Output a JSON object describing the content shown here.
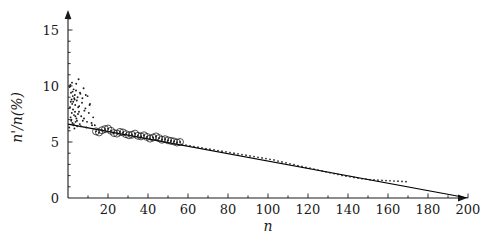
{
  "chart_data": {
    "type": "scatter",
    "title": "",
    "xlabel": "n",
    "ylabel": "n'/n(%)",
    "xlim": [
      0,
      210
    ],
    "ylim": [
      0,
      16.8
    ],
    "grid": false,
    "legend": null,
    "xticks": [
      20,
      40,
      60,
      80,
      100,
      120,
      140,
      160,
      180,
      200
    ],
    "xtick_labels": [
      "20",
      "40",
      "60",
      "80",
      "100",
      "120",
      "140",
      "160",
      "180",
      "200"
    ],
    "yticks": [
      0,
      5,
      10,
      15
    ],
    "ytick_labels": [
      "0",
      "5",
      "10",
      "15"
    ],
    "x_minor_tick_step": 10,
    "y_minor_tick_step": 1,
    "axis_style": "arrow-ended",
    "series": [
      {
        "name": "fit-line",
        "type": "line",
        "style": "solid",
        "color": "#000000",
        "points": [
          [
            0,
            6.6
          ],
          [
            200,
            0.0
          ]
        ],
        "slope": -0.033,
        "intercept": 6.6
      },
      {
        "name": "noisy-cluster",
        "type": "scatter",
        "marker": "dot",
        "color": "#1a1a1a",
        "x": [
          0.6,
          0.8,
          1.0,
          1.2,
          1.3,
          1.5,
          1.6,
          1.8,
          1.9,
          2.0,
          2.1,
          2.2,
          2.4,
          2.5,
          2.6,
          2.7,
          2.8,
          3.0,
          3.1,
          3.2,
          3.4,
          3.5,
          3.6,
          3.8,
          4.0,
          4.2,
          4.4,
          4.6,
          4.8,
          5.0,
          5.3,
          5.6,
          5.9,
          6.2,
          6.6,
          7.0,
          7.4,
          7.8,
          8.2,
          8.7,
          9.2,
          9.8,
          10.4,
          11.0,
          11.8,
          12.6,
          13.4,
          1.1,
          1.4,
          1.7,
          2.3,
          2.9,
          3.3,
          3.7,
          4.1,
          4.5,
          5.1,
          5.5,
          6.0,
          6.4,
          7.2,
          8.0,
          8.9,
          9.5,
          10.8,
          12.0
        ],
        "y": [
          6.3,
          9.9,
          8.1,
          10.1,
          7.2,
          9.4,
          6.9,
          8.8,
          7.6,
          10.3,
          8.4,
          6.7,
          9.1,
          7.9,
          8.6,
          6.5,
          9.7,
          7.4,
          8.9,
          6.2,
          9.2,
          7.7,
          8.3,
          6.8,
          9.6,
          7.1,
          8.7,
          6.4,
          9.0,
          7.5,
          10.6,
          8.2,
          6.6,
          9.3,
          7.3,
          8.5,
          6.9,
          9.8,
          7.8,
          8.0,
          6.3,
          9.1,
          7.6,
          8.4,
          6.7,
          7.2,
          6.5,
          10.0,
          8.6,
          7.0,
          9.5,
          6.6,
          8.8,
          7.3,
          10.2,
          6.9,
          8.1,
          7.7,
          9.4,
          6.4,
          8.9,
          7.1,
          9.2,
          6.8,
          8.3,
          6.5
        ]
      },
      {
        "name": "circled-markers",
        "type": "scatter",
        "marker": "circle-open-with-dot",
        "color": "#1a1a1a",
        "x": [
          14.0,
          15.5,
          17.0,
          18.5,
          20.0,
          21.5,
          23.0,
          24.5,
          26.0,
          27.5,
          29.0,
          30.5,
          32.0,
          33.5,
          35.0,
          36.5,
          38.0,
          39.5,
          41.0,
          42.5,
          44.0,
          45.5,
          47.0,
          48.5,
          50.0,
          51.5,
          53.0,
          54.5,
          56.0
        ],
        "y": [
          5.95,
          5.85,
          6.05,
          6.15,
          6.2,
          6.0,
          5.8,
          5.75,
          5.9,
          5.85,
          5.7,
          5.6,
          5.65,
          5.75,
          5.55,
          5.5,
          5.6,
          5.45,
          5.3,
          5.4,
          5.5,
          5.35,
          5.2,
          5.25,
          5.15,
          5.1,
          5.05,
          4.95,
          5.0
        ]
      },
      {
        "name": "dotted-trail",
        "type": "scatter",
        "marker": "dot",
        "color": "#1a1a1a",
        "x": [
          57,
          59,
          61,
          63,
          65,
          67,
          69,
          71,
          73,
          75,
          77,
          79,
          81,
          83,
          85,
          87,
          89,
          91,
          93,
          95,
          97,
          99,
          101,
          103,
          105,
          107,
          109,
          111,
          113,
          115,
          117,
          119,
          121,
          123,
          125,
          127,
          129,
          131,
          133,
          135,
          137,
          139,
          141,
          143,
          145,
          147,
          149,
          151,
          153,
          155,
          157,
          159,
          161,
          163,
          165,
          167,
          169
        ],
        "y": [
          4.78,
          4.72,
          4.66,
          4.6,
          4.54,
          4.48,
          4.42,
          4.36,
          4.3,
          4.24,
          4.18,
          4.12,
          4.06,
          4.0,
          3.94,
          3.88,
          3.82,
          3.76,
          3.7,
          3.64,
          3.58,
          3.52,
          3.46,
          3.4,
          3.3,
          3.22,
          3.14,
          3.06,
          2.98,
          2.9,
          2.82,
          2.74,
          2.66,
          2.58,
          2.5,
          2.42,
          2.34,
          2.26,
          2.18,
          2.1,
          2.02,
          1.96,
          1.9,
          1.84,
          1.78,
          1.72,
          1.68,
          1.64,
          1.62,
          1.6,
          1.58,
          1.56,
          1.54,
          1.52,
          1.5,
          1.48,
          1.46
        ]
      }
    ]
  }
}
